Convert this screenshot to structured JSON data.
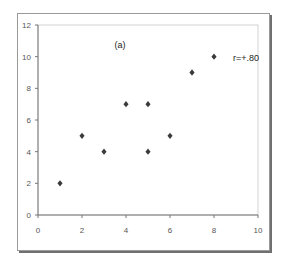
{
  "chart_data": {
    "type": "scatter",
    "title": "(a)",
    "annotation": "r=+.80",
    "xlabel": "",
    "ylabel": "",
    "xlim": [
      0,
      10
    ],
    "ylim": [
      0,
      12
    ],
    "xticks": [
      0,
      2,
      4,
      6,
      8,
      10
    ],
    "yticks": [
      0,
      2,
      4,
      6,
      8,
      10,
      12
    ],
    "grid": false,
    "legend": false,
    "marker": "diamond",
    "marker_color": "#3a3a3a",
    "series": [
      {
        "name": "data",
        "points": [
          {
            "x": 1,
            "y": 2
          },
          {
            "x": 2,
            "y": 5
          },
          {
            "x": 3,
            "y": 4
          },
          {
            "x": 4,
            "y": 7
          },
          {
            "x": 5,
            "y": 7
          },
          {
            "x": 5,
            "y": 4
          },
          {
            "x": 6,
            "y": 5
          },
          {
            "x": 7,
            "y": 9
          },
          {
            "x": 8,
            "y": 10
          }
        ]
      }
    ]
  }
}
